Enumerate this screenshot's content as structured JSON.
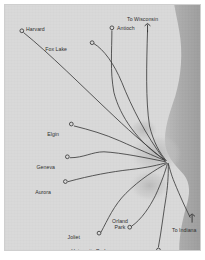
{
  "map": {
    "title": "Metra Commuter Rail System Map",
    "colors": {
      "land": "#d9d9d9",
      "lake": "#a9a9a9",
      "urban_shade": "#bdbdbd",
      "line": "#3a3a3a",
      "station_stroke": "#2e2e2e",
      "label_text": "#2e2e2e",
      "page_background": "#ffffff"
    },
    "water_body": "Lake Michigan",
    "stations": [
      {
        "id": "harvard",
        "label": "Harvard",
        "x": 17,
        "y": 26,
        "label_x": 21,
        "label_y": 21,
        "align": "right",
        "lines": 1
      },
      {
        "id": "fox-lake",
        "label": "Fox Lake",
        "x": 88,
        "y": 38,
        "label_x": 64,
        "label_y": 41,
        "align": "left",
        "lines": 1
      },
      {
        "id": "antioch",
        "label": "Antioch",
        "x": 108,
        "y": 23,
        "label_x": 112,
        "label_y": 20,
        "align": "right",
        "lines": 1
      },
      {
        "id": "to-wisconsin",
        "label": "To Wisconsin",
        "x": 144,
        "y": 23,
        "label_x": 122,
        "label_y": 11,
        "align": "right",
        "lines": 1,
        "terminus": true
      },
      {
        "id": "elgin",
        "label": "Elgin",
        "x": 67,
        "y": 120,
        "label_x": 56,
        "label_y": 126,
        "align": "left",
        "lines": 1
      },
      {
        "id": "geneva",
        "label": "Geneva",
        "x": 63,
        "y": 153,
        "label_x": 52,
        "label_y": 159,
        "align": "left",
        "lines": 1
      },
      {
        "id": "aurora",
        "label": "Aurora",
        "x": 61,
        "y": 178,
        "label_x": 48,
        "label_y": 184,
        "align": "left",
        "lines": 1
      },
      {
        "id": "joliet",
        "label": "Joliet",
        "x": 95,
        "y": 230,
        "label_x": 77,
        "label_y": 229,
        "align": "left",
        "lines": 1
      },
      {
        "id": "orland-park",
        "label": "Orland Park",
        "x": 126,
        "y": 224,
        "label_x": 104,
        "label_y": 213,
        "align": "center",
        "lines": 2
      },
      {
        "id": "university-park",
        "label": "University Park",
        "x": 155,
        "y": 247,
        "label_x": 104,
        "label_y": 243,
        "align": "left",
        "lines": 1
      },
      {
        "id": "to-indiana",
        "label": "To Indiana",
        "x": 189,
        "y": 215,
        "label_x": 167,
        "label_y": 222,
        "align": "right",
        "lines": 1,
        "terminus": true
      }
    ],
    "hub": {
      "id": "chicago-hub",
      "x": 164,
      "y": 158
    },
    "routes": [
      {
        "id": "route-harvard",
        "from": "harvard",
        "to": "chicago-hub",
        "path": "M 19 28 C 44 48 78 82 110 112 C 130 131 148 146 162 157"
      },
      {
        "id": "route-fox-lake",
        "from": "fox-lake",
        "to": "chicago-hub",
        "path": "M 90 39 C 100 45 110 59 118 78 C 128 103 142 131 161 156"
      },
      {
        "id": "route-antioch",
        "from": "antioch",
        "to": "chicago-hub",
        "path": "M 108 26 C 108 46 106 66 110 88 C 116 112 134 138 161 156"
      },
      {
        "id": "route-wisconsin",
        "from": "to-wisconsin",
        "to": "chicago-hub",
        "path": "M 144 26 C 143 60 142 96 146 122 C 150 138 156 149 163 157"
      },
      {
        "id": "route-elgin",
        "from": "elgin",
        "to": "chicago-hub",
        "path": "M 70 122 C 86 126 100 130 116 137 C 134 145 150 152 162 157"
      },
      {
        "id": "route-geneva",
        "from": "geneva",
        "to": "chicago-hub",
        "path": "M 66 154 C 80 154 88 148 100 148 C 118 149 142 154 162 158"
      },
      {
        "id": "route-aurora",
        "from": "aurora",
        "to": "chicago-hub",
        "path": "M 64 178 C 86 172 108 168 126 166 C 144 164 156 161 163 159"
      },
      {
        "id": "route-joliet",
        "from": "joliet",
        "to": "chicago-hub",
        "path": "M 97 229 C 104 216 110 202 122 190 C 136 176 152 166 163 160"
      },
      {
        "id": "route-orland-park",
        "from": "orland-park",
        "to": "chicago-hub",
        "path": "M 128 223 C 138 216 146 204 152 192 C 158 179 162 168 164 160"
      },
      {
        "id": "route-university-park",
        "from": "university-park",
        "to": "chicago-hub",
        "path": "M 155 244 C 158 228 160 210 163 192 C 165 178 165 168 165 160"
      },
      {
        "id": "route-indiana",
        "from": "to-indiana",
        "to": "chicago-hub",
        "path": "M 187 214 C 180 200 174 186 170 176 C 167 168 166 163 165 160"
      }
    ]
  }
}
